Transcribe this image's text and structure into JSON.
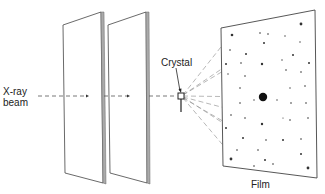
{
  "diagram": {
    "labels": {
      "xray_beam_line1": "X-ray",
      "xray_beam_line2": "beam",
      "crystal": "Crystal",
      "film": "Film"
    },
    "components": [
      {
        "id": "collimator-plate-1",
        "type": "plate",
        "points": [
          [
            63,
            25
          ],
          [
            101,
            12
          ],
          [
            103,
            183
          ],
          [
            65,
            173
          ]
        ]
      },
      {
        "id": "collimator-plate-2",
        "type": "plate",
        "points": [
          [
            108,
            25
          ],
          [
            146,
            12
          ],
          [
            147,
            183
          ],
          [
            110,
            173
          ]
        ]
      },
      {
        "id": "crystal",
        "type": "sample",
        "center": [
          181,
          96
        ]
      },
      {
        "id": "film",
        "type": "detector",
        "points": [
          [
            221,
            28
          ],
          [
            315,
            10
          ],
          [
            317,
            178
          ],
          [
            223,
            166
          ]
        ]
      }
    ],
    "beam_y": 96,
    "central_spot": {
      "cx": 263,
      "cy": 97,
      "r": 4
    },
    "colors": {
      "line": "#333333",
      "plate_edge": "#777777",
      "spot": "#111111",
      "ray": "#999999"
    }
  }
}
